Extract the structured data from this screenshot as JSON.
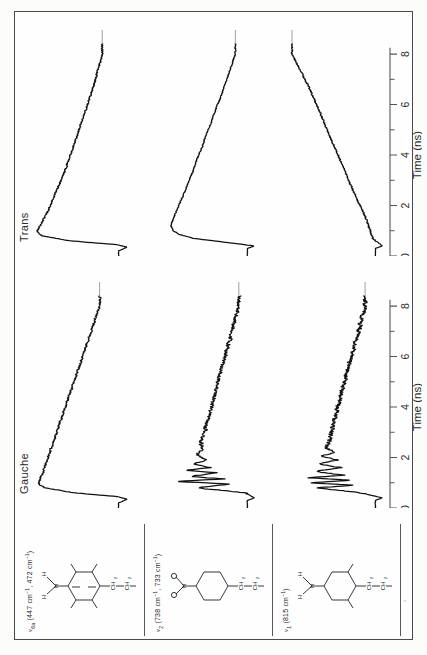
{
  "figure": {
    "orientation": "rotated-90-ccw",
    "background_color": "#fcfcfa",
    "frame_color": "#4a4a4a",
    "trace_color": "#111111",
    "axis_color": "#555555"
  },
  "columns": {
    "structure_header": "",
    "gauche_header": "Gauche",
    "trans_header": "Trans"
  },
  "axis": {
    "title": "Time  (ns)",
    "tick_labels": [
      "0",
      "2",
      "4",
      "6",
      "8"
    ],
    "tick_values": [
      0,
      2,
      4,
      6,
      8
    ],
    "minor_per_major": 2,
    "xlim": [
      0,
      8.4
    ],
    "units": "ns"
  },
  "rows": [
    {
      "mode_symbol": "ν",
      "mode_sub": "6a",
      "mode_label": "ν6a (447 cm⁻¹, 472 cm⁻¹)",
      "frequencies": [
        "447 cm⁻¹",
        "472 cm⁻¹"
      ],
      "freq_text": "(447 cm",
      "freq_text_2": ", 472 cm",
      "structure_name": "benzene-ring-with-NH2-and-propyl-chain",
      "structure_atoms": {
        "amine": "N",
        "amine_h_left": "H",
        "amine_h_right": "H",
        "chain": [
          "CH",
          "CH",
          "CH"
        ],
        "chain_subs": [
          "2",
          "2",
          "3"
        ]
      }
    },
    {
      "mode_symbol": "ν",
      "mode_sub": "2",
      "mode_label": "ν2 (738 cm⁻¹, 733 cm⁻¹)",
      "frequencies": [
        "738 cm⁻¹",
        "733 cm⁻¹"
      ],
      "freq_text": "(738 cm",
      "freq_text_2": ", 733 cm",
      "structure_name": "ring-with-NH2-umbrella-and-propyl-chain",
      "structure_atoms": {
        "amine": "N",
        "amine_h_left": "H",
        "amine_h_right": "H",
        "chain": [
          "CH",
          "CH",
          "CH"
        ],
        "chain_subs": [
          "2",
          "2",
          "3"
        ]
      }
    },
    {
      "mode_symbol": "ν",
      "mode_sub": "1",
      "mode_label": "ν1 (815 cm⁻¹)",
      "frequencies": [
        "815 cm⁻¹"
      ],
      "freq_text": "(815 cm",
      "freq_text_2": "",
      "structure_name": "ring-with-NH2-and-propyl-chain",
      "structure_atoms": {
        "amine": "N",
        "amine_h_left": "H",
        "amine_h_right": "H",
        "chain": [
          "CH",
          "CH",
          "CH"
        ],
        "chain_subs": [
          "2",
          "2",
          "3"
        ]
      }
    }
  ],
  "chart_data": {
    "type": "line",
    "title": "",
    "xlabel": "Time  (ns)",
    "ylabel": "",
    "xlim": [
      0,
      8.4
    ],
    "ylim": [
      0,
      1
    ],
    "grid": false,
    "legend": "none",
    "panels": [
      {
        "row": "ν6a (447 cm⁻¹, 472 cm⁻¹)",
        "column": "Gauche",
        "description": "sharp negative spike near t=0.35 then fast rise to plateau by t=1.0, followed by slow noisy monotonic decay",
        "x": [
          0.0,
          0.2,
          0.35,
          0.45,
          0.6,
          0.8,
          0.95,
          1.1,
          1.4,
          1.8,
          2.2,
          2.6,
          3.0,
          3.5,
          4.0,
          4.5,
          5.0,
          5.5,
          6.0,
          6.5,
          7.0,
          7.5,
          8.0
        ],
        "y": [
          0.04,
          0.04,
          -0.06,
          0.05,
          0.55,
          0.9,
          0.97,
          0.96,
          0.92,
          0.88,
          0.84,
          0.8,
          0.76,
          0.71,
          0.66,
          0.61,
          0.56,
          0.51,
          0.46,
          0.41,
          0.36,
          0.31,
          0.26
        ]
      },
      {
        "row": "ν6a (447 cm⁻¹, 472 cm⁻¹)",
        "column": "Trans",
        "description": "sharp negative spike near t=0.35 then fast rise to peak at t=0.95, then smooth decay",
        "x": [
          0.0,
          0.2,
          0.35,
          0.45,
          0.6,
          0.8,
          0.95,
          1.1,
          1.4,
          1.8,
          2.2,
          2.6,
          3.0,
          3.5,
          4.0,
          4.5,
          5.0,
          5.5,
          6.0,
          6.5,
          7.0,
          7.5,
          8.0
        ],
        "y": [
          0.04,
          0.04,
          -0.06,
          0.06,
          0.6,
          0.93,
          0.99,
          0.97,
          0.92,
          0.86,
          0.81,
          0.76,
          0.71,
          0.65,
          0.6,
          0.55,
          0.5,
          0.45,
          0.4,
          0.35,
          0.31,
          0.27,
          0.23
        ]
      },
      {
        "row": "ν2 (738 cm⁻¹, 733 cm⁻¹)",
        "column": "Gauche",
        "description": "strongly oscillatory noisy transient between t=0.8 and t=2.5 with several spikes, decaying baseline afterwards",
        "x": [
          0.0,
          0.3,
          0.4,
          0.6,
          0.8,
          0.95,
          1.05,
          1.15,
          1.25,
          1.4,
          1.5,
          1.6,
          1.75,
          1.9,
          2.1,
          2.3,
          2.6,
          3.0,
          3.5,
          4.0,
          4.5,
          5.0,
          5.5,
          6.0,
          6.5,
          7.0,
          7.5,
          8.0
        ],
        "y": [
          0.03,
          0.03,
          -0.05,
          0.05,
          0.62,
          0.22,
          0.88,
          0.3,
          0.7,
          0.4,
          0.76,
          0.46,
          0.66,
          0.52,
          0.62,
          0.55,
          0.57,
          0.53,
          0.49,
          0.45,
          0.41,
          0.37,
          0.33,
          0.29,
          0.25,
          0.21,
          0.17,
          0.13
        ]
      },
      {
        "row": "ν2 (738 cm⁻¹, 733 cm⁻¹)",
        "column": "Trans",
        "description": "smooth fast rise to plateau near t=1.2 then slow smooth decay, low noise",
        "x": [
          0.0,
          0.3,
          0.4,
          0.55,
          0.7,
          0.85,
          1.0,
          1.2,
          1.5,
          1.9,
          2.3,
          2.8,
          3.3,
          3.8,
          4.3,
          4.8,
          5.3,
          5.8,
          6.3,
          6.8,
          7.3,
          7.8,
          8.0
        ],
        "y": [
          0.03,
          0.03,
          -0.05,
          0.3,
          0.66,
          0.82,
          0.89,
          0.92,
          0.89,
          0.84,
          0.79,
          0.73,
          0.67,
          0.62,
          0.56,
          0.51,
          0.45,
          0.4,
          0.34,
          0.29,
          0.24,
          0.19,
          0.17
        ]
      },
      {
        "row": "ν1 (815 cm⁻¹)",
        "column": "Gauche",
        "description": "dense oscillatory noise burst from t=0.8 to t=2.6 then noisy slow decay to baseline",
        "x": [
          0.0,
          0.3,
          0.4,
          0.6,
          0.8,
          0.9,
          1.0,
          1.1,
          1.2,
          1.3,
          1.45,
          1.6,
          1.75,
          1.9,
          2.05,
          2.2,
          2.4,
          2.7,
          3.1,
          3.6,
          4.1,
          4.6,
          5.1,
          5.6,
          6.1,
          6.6,
          7.1,
          7.6,
          8.0
        ],
        "y": [
          0.03,
          0.03,
          -0.05,
          0.2,
          0.7,
          0.28,
          0.78,
          0.33,
          0.82,
          0.38,
          0.74,
          0.44,
          0.7,
          0.48,
          0.66,
          0.52,
          0.6,
          0.56,
          0.54,
          0.5,
          0.46,
          0.42,
          0.38,
          0.34,
          0.3,
          0.26,
          0.22,
          0.18,
          0.15
        ]
      },
      {
        "row": "ν1 (815 cm⁻¹)",
        "column": "Trans",
        "description": "very slow rise until t=2 then steep rise to maximum near t=8",
        "x": [
          0.0,
          0.3,
          0.4,
          0.7,
          1.0,
          1.4,
          1.8,
          2.2,
          2.6,
          3.0,
          3.4,
          3.8,
          4.2,
          4.6,
          5.0,
          5.4,
          5.8,
          6.2,
          6.6,
          7.0,
          7.4,
          7.8,
          8.0
        ],
        "y": [
          0.03,
          0.03,
          -0.05,
          0.06,
          0.09,
          0.13,
          0.18,
          0.24,
          0.29,
          0.34,
          0.39,
          0.44,
          0.49,
          0.54,
          0.59,
          0.64,
          0.69,
          0.74,
          0.79,
          0.85,
          0.91,
          0.97,
          1.0
        ]
      }
    ]
  }
}
